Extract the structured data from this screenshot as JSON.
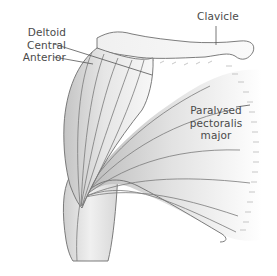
{
  "diagram": {
    "labels": {
      "deltoid": {
        "lines": [
          "Deltoid",
          "Central",
          "Anterior"
        ]
      },
      "clavicle": {
        "text": "Clavicle"
      },
      "pectoralis": {
        "lines": [
          "Paralysed",
          "pectoralis",
          "major"
        ]
      }
    },
    "colors": {
      "outline": "#6e6e6e",
      "fiber": "#7a7a7a",
      "shade_dark": "#bdbdbd",
      "shade_light": "#f4f4f4",
      "label_text": "#4a4a4a",
      "leader": "#555555"
    }
  }
}
